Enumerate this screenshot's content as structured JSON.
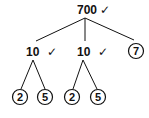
{
  "diagram": {
    "type": "factor-tree",
    "root": {
      "value": "700",
      "mark": "✓"
    },
    "level1": [
      {
        "value": "10",
        "mark": "✓",
        "circled": false
      },
      {
        "value": "10",
        "mark": "✓",
        "circled": false
      },
      {
        "value": "7",
        "circled": true
      }
    ],
    "level2": [
      {
        "parent": 0,
        "value": "2",
        "circled": true
      },
      {
        "parent": 0,
        "value": "5",
        "circled": true
      },
      {
        "parent": 1,
        "value": "2",
        "circled": true
      },
      {
        "parent": 1,
        "value": "5",
        "circled": true
      }
    ],
    "colors": {
      "ink": "#111111",
      "background": "#ffffff"
    }
  }
}
